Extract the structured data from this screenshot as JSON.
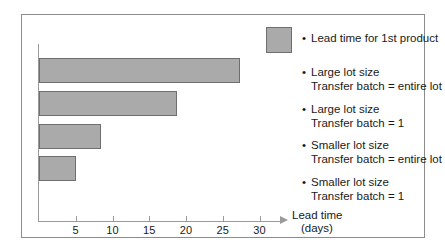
{
  "chart_data": {
    "type": "bar",
    "orientation": "horizontal",
    "title": "",
    "xlabel_line1": "Lead time",
    "xlabel_line2": "(days)",
    "ylabel": "",
    "xlim": [
      0,
      33
    ],
    "xticks": [
      5,
      10,
      15,
      20,
      25,
      30
    ],
    "xtick_labels": [
      "5",
      "10",
      "15",
      "20",
      "25",
      "30"
    ],
    "grid": false,
    "legend_position": "right",
    "bar_color": "#aaaaaa",
    "bar_edge_color": "#6f6f6f",
    "axis_color": "#9a9a9a",
    "categories": [
      "Large lot size, Transfer batch = entire lot",
      "Large lot size, Transfer batch = 1",
      "Smaller lot size, Transfer batch = entire lot",
      "Smaller lot size, Transfer batch = 1"
    ],
    "values": [
      27.3,
      18.8,
      8.5,
      5.0
    ],
    "series": [
      {
        "name": "Lead time for 1st product",
        "values": [
          27.3,
          18.8,
          8.5,
          5.0
        ]
      }
    ]
  },
  "legend": {
    "swatch_label": "Lead time for 1st product",
    "bullet": "•",
    "entries": [
      {
        "line1": "Large lot size",
        "line2": "Transfer batch = entire lot"
      },
      {
        "line1": "Large lot size",
        "line2": "Transfer batch = 1"
      },
      {
        "line1": "Smaller lot size",
        "line2": "Transfer batch = entire lot"
      },
      {
        "line1": "Smaller lot size",
        "line2": "Transfer batch = 1"
      }
    ]
  },
  "axis": {
    "title_line1": "Lead time",
    "title_line2": "(days)",
    "ticks": [
      "5",
      "10",
      "15",
      "20",
      "25",
      "30"
    ]
  }
}
